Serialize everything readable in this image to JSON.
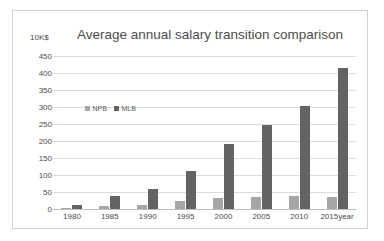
{
  "chart_data": {
    "type": "bar",
    "title": "Average annual salary transition comparison",
    "xlabel": "year",
    "ylabel": "10K$",
    "categories": [
      "1980",
      "1985",
      "1990",
      "1995",
      "2000",
      "2005",
      "2010",
      "2015"
    ],
    "series": [
      {
        "name": "NPB",
        "color": "#a6a6a6",
        "values": [
          4,
          8,
          12,
          25,
          31,
          35,
          38,
          36
        ]
      },
      {
        "name": "MLB",
        "color": "#636363",
        "values": [
          13,
          38,
          60,
          112,
          190,
          248,
          303,
          415
        ]
      }
    ],
    "ylim": [
      0,
      450
    ],
    "ytick_step": 50,
    "yticks": [
      "450",
      "400",
      "350",
      "300",
      "250",
      "200",
      "150",
      "100",
      "50",
      "0"
    ],
    "grid": true,
    "legend_position": "inside-upper-left"
  },
  "legend": {
    "items": [
      {
        "label": "NPB"
      },
      {
        "label": "MLB"
      }
    ]
  },
  "axis": {
    "unit_label": "10K$",
    "x_unit_suffix": "year"
  }
}
